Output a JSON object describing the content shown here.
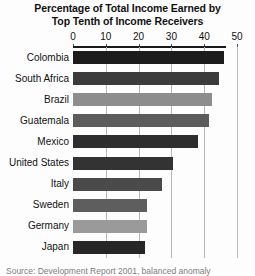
{
  "chart_data": {
    "type": "bar",
    "orientation": "horizontal",
    "title": "Percentage of Total Income Earned by Top Tenth of Income Receivers",
    "title_lines": [
      "Percentage of Total Income Earned by",
      "Top Tenth of Income Receivers"
    ],
    "xlabel": "",
    "ylabel": "",
    "xlim": [
      0,
      50
    ],
    "xticks": [
      0,
      10,
      20,
      30,
      40,
      50
    ],
    "xtick_labels": [
      "0",
      "10",
      "20",
      "30",
      "40",
      "50"
    ],
    "grid": "vertical",
    "legend": "none",
    "categories": [
      "Colombia",
      "South Africa",
      "Brazil",
      "Guatemala",
      "Mexico",
      "United States",
      "Italy",
      "Sweden",
      "Germany",
      "Japan"
    ],
    "values": [
      46,
      44.5,
      42.5,
      41.5,
      38,
      30.5,
      27,
      22.5,
      22.5,
      22
    ],
    "bar_colors": [
      "#1c1c1c",
      "#3b3b3b",
      "#8d8d8d",
      "#5c5c5c",
      "#2e2e2e",
      "#333333",
      "#4a4a4a",
      "#5e5e5e",
      "#9a9a9a",
      "#262626"
    ]
  },
  "source_note": "Source: Development Report 2001, balanced anomaly",
  "colors": {
    "background": "#fdfdfd",
    "axis": "#1a1a1a",
    "gridline": "#b9b9b9",
    "text": "#111111"
  }
}
